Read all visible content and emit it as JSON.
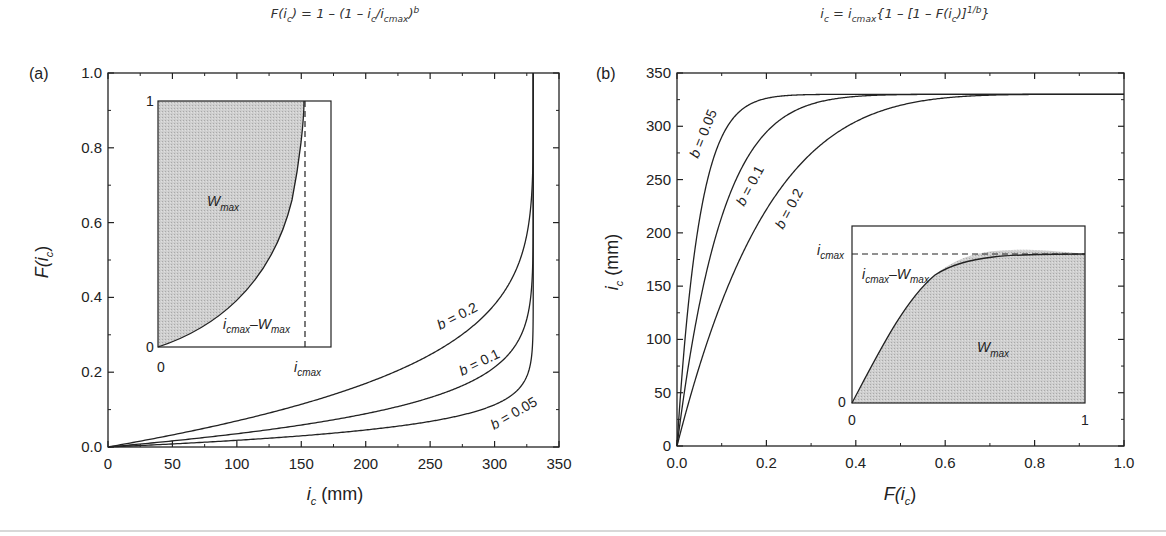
{
  "figure": {
    "panel_a": {
      "label": "(a)",
      "title_parts": [
        "F(i",
        "c",
        ") = 1 – (1 – i",
        "c",
        "/i",
        "cmax",
        ")",
        "b"
      ],
      "xlabel_main": "i",
      "xlabel_sub": "c",
      "xlabel_unit": " (mm)",
      "ylabel_main": "F(i",
      "ylabel_sub": "c",
      "ylabel_end": ")",
      "inset": {
        "y_top": "1",
        "y_bottom": "0",
        "x_left": "0",
        "x_right_main": "i",
        "x_right_sub": "cmax",
        "area_label_main": "W",
        "area_label_sub": "max",
        "complement_i": "i",
        "complement_i_sub": "cmax",
        "complement_dash": "–W",
        "complement_w_sub": "max"
      },
      "curve_labels": [
        "b = 0.2",
        "b = 0.1",
        "b = 0.05"
      ]
    },
    "panel_b": {
      "label": "(b)",
      "title_parts": [
        "i",
        "c",
        " = i",
        "cmax",
        "{1 – [1 – F(i",
        "c",
        ")]",
        "1/b",
        "}"
      ],
      "xlabel_main": "F(i",
      "xlabel_sub": "c",
      "xlabel_end": ")",
      "ylabel_main": "i",
      "ylabel_sub": "c",
      "ylabel_unit": " (mm)",
      "inset": {
        "y_top_main": "i",
        "y_top_sub": "cmax",
        "y_bottom": "0",
        "x_left": "0",
        "x_right": "1",
        "area_label_main": "W",
        "area_label_sub": "max",
        "complement_i": "i",
        "complement_i_sub": "cmax",
        "complement_dash": "–W",
        "complement_w_sub": "max"
      },
      "curve_labels": [
        "b = 0.05",
        "b = 0.1",
        "b = 0.2"
      ]
    }
  },
  "chart_data": [
    {
      "type": "line",
      "title": "F(i_c) = 1 - (1 - i_c/i_cmax)^b",
      "panel": "(a)",
      "xlabel": "i_c (mm)",
      "ylabel": "F(i_c)",
      "xlim": [
        0,
        350
      ],
      "ylim": [
        0,
        1.0
      ],
      "xticks": [
        "0",
        "50",
        "100",
        "150",
        "200",
        "250",
        "300",
        "350"
      ],
      "yticks": [
        "0.0",
        "0.2",
        "0.4",
        "0.6",
        "0.8",
        "1.0"
      ],
      "grid": false,
      "i_cmax": 330,
      "x": [
        0,
        50,
        100,
        150,
        200,
        250,
        300,
        320,
        328,
        330
      ],
      "series": [
        {
          "name": "b = 0.2",
          "values": [
            0.0,
            0.032,
            0.069,
            0.115,
            0.17,
            0.248,
            0.379,
            0.503,
            0.655,
            1.0
          ]
        },
        {
          "name": "b = 0.1",
          "values": [
            0.0,
            0.016,
            0.035,
            0.059,
            0.089,
            0.133,
            0.212,
            0.295,
            0.413,
            1.0
          ]
        },
        {
          "name": "b = 0.05",
          "values": [
            0.0,
            0.008,
            0.018,
            0.03,
            0.045,
            0.069,
            0.113,
            0.161,
            0.234,
            1.0
          ]
        }
      ],
      "inset": {
        "description": "Schematic of F vs i_c for one b, shaded region W_max left of curve, dashed vertical line at i_cmax",
        "xticks": [
          "0",
          "i_cmax"
        ],
        "yticks": [
          "0",
          "1"
        ],
        "labels": [
          "W_max",
          "i_cmax - W_max"
        ]
      }
    },
    {
      "type": "line",
      "title": "i_c = i_cmax{1 - [1 - F(i_c)]^(1/b)}",
      "panel": "(b)",
      "xlabel": "F(i_c)",
      "ylabel": "i_c (mm)",
      "xlim": [
        0,
        1.0
      ],
      "ylim": [
        0,
        350
      ],
      "xticks": [
        "0.0",
        "0.2",
        "0.4",
        "0.6",
        "0.8",
        "1.0"
      ],
      "yticks": [
        "0",
        "50",
        "100",
        "150",
        "200",
        "250",
        "300",
        "350"
      ],
      "grid": false,
      "i_cmax": 330,
      "x": [
        0,
        0.02,
        0.05,
        0.1,
        0.2,
        0.3,
        0.4,
        0.6,
        0.8,
        1.0
      ],
      "series": [
        {
          "name": "b = 0.05",
          "values": [
            0,
            110,
            213,
            289,
            326,
            330,
            330,
            330,
            330,
            330
          ]
        },
        {
          "name": "b = 0.1",
          "values": [
            0,
            60,
            132,
            215,
            293,
            320,
            328,
            330,
            330,
            330
          ]
        },
        {
          "name": "b = 0.2",
          "values": [
            0,
            32,
            74,
            135,
            221,
            275,
            304,
            325,
            330,
            330
          ]
        }
      ],
      "inset": {
        "description": "Schematic of i_c vs F for one b, shaded region W_max under curve, dashed horizontal line at i_cmax",
        "xticks": [
          "0",
          "1"
        ],
        "yticks": [
          "0",
          "i_cmax"
        ],
        "labels": [
          "W_max",
          "i_cmax - W_max"
        ]
      }
    }
  ]
}
